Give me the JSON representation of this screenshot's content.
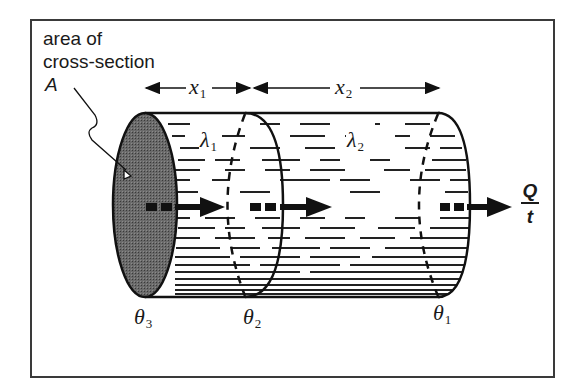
{
  "diagram": {
    "type": "cylinder-heat-conduction",
    "colors": {
      "frame": "#3a3a3a",
      "outline": "#111111",
      "end_face_fill": "#5a5a5a",
      "hatching": "#222222",
      "background": "#ffffff"
    },
    "labels": {
      "area_line1": "area of",
      "area_line2": "cross-section",
      "area_symbol": "A",
      "x1": "x",
      "x1_sub": "1",
      "x2": "x",
      "x2_sub": "2",
      "lambda1": "λ",
      "lambda1_sub": "1",
      "lambda2": "λ",
      "lambda2_sub": "2",
      "theta3": "θ",
      "theta3_sub": "3",
      "theta2": "θ",
      "theta2_sub": "2",
      "theta1": "θ",
      "theta1_sub": "1",
      "flow_numerator": "Q",
      "flow_denominator": "t"
    },
    "sections": [
      {
        "name": "section-1",
        "length_label": "x1",
        "conductivity_label": "λ1",
        "left_temp": "θ3",
        "right_temp": "θ2"
      },
      {
        "name": "section-2",
        "length_label": "x2",
        "conductivity_label": "λ2",
        "left_temp": "θ2",
        "right_temp": "θ1"
      }
    ]
  }
}
